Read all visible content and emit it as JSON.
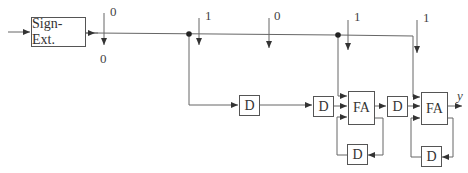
{
  "diagram": {
    "type": "bit-serial adder circuit",
    "sign_ext": {
      "label": "Sign-Ext."
    },
    "bits": [
      {
        "label": "0",
        "below_label": "0"
      },
      {
        "label": "1"
      },
      {
        "label": "0"
      },
      {
        "label": "1"
      },
      {
        "label": "1"
      }
    ],
    "delays": [
      {
        "label": "D"
      },
      {
        "label": "D"
      },
      {
        "label": "D"
      },
      {
        "label": "D"
      },
      {
        "label": "D"
      }
    ],
    "adders": [
      {
        "label": "FA"
      },
      {
        "label": "FA"
      }
    ],
    "output": {
      "label": "y"
    },
    "colors": {
      "line": "#555555",
      "text": "#444444"
    }
  }
}
